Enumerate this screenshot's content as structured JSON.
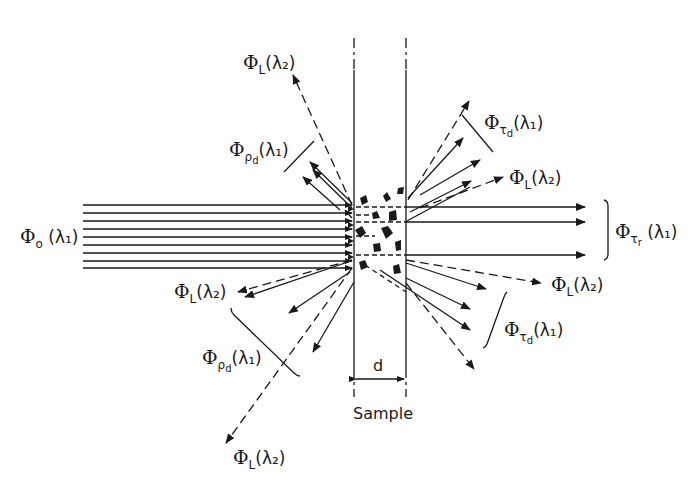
{
  "figure": {
    "sample_label": "Sample",
    "thickness_label": "d",
    "colors": {
      "ink": "#1a1a1a",
      "background": "#ffffff"
    }
  },
  "labels": {
    "incident": {
      "symbol": "Φ",
      "sub": "o",
      "arg": "(λ₁)"
    },
    "transmitted_regular": {
      "symbol": "Φ",
      "sub": "τ",
      "subsub": "r",
      "arg": "(λ₁)"
    },
    "diffuse_transmit_upper": {
      "symbol": "Φ",
      "sub": "τ",
      "subsub": "d",
      "arg": "(λ₁)"
    },
    "diffuse_transmit_lower": {
      "symbol": "Φ",
      "sub": "τ",
      "subsub": "d",
      "arg": "(λ₁)"
    },
    "diffuse_reflect_upper": {
      "symbol": "Φ",
      "sub": "ρ",
      "subsub": "d",
      "arg": "(λ₁)"
    },
    "diffuse_reflect_lower": {
      "symbol": "Φ",
      "sub": "ρ",
      "subsub": "d",
      "arg": "(λ₁)"
    },
    "lum_top_left": {
      "symbol": "Φ",
      "sub": "L",
      "arg": "(λ₂)"
    },
    "lum_mid_left": {
      "symbol": "Φ",
      "sub": "L",
      "arg": "(λ₂)"
    },
    "lum_bottom_left": {
      "symbol": "Φ",
      "sub": "L",
      "arg": "(λ₂)"
    },
    "lum_upper_right": {
      "symbol": "Φ",
      "sub": "L",
      "arg": "(λ₂)"
    },
    "lum_lower_right": {
      "symbol": "Φ",
      "sub": "L",
      "arg": "(λ₂)"
    }
  }
}
